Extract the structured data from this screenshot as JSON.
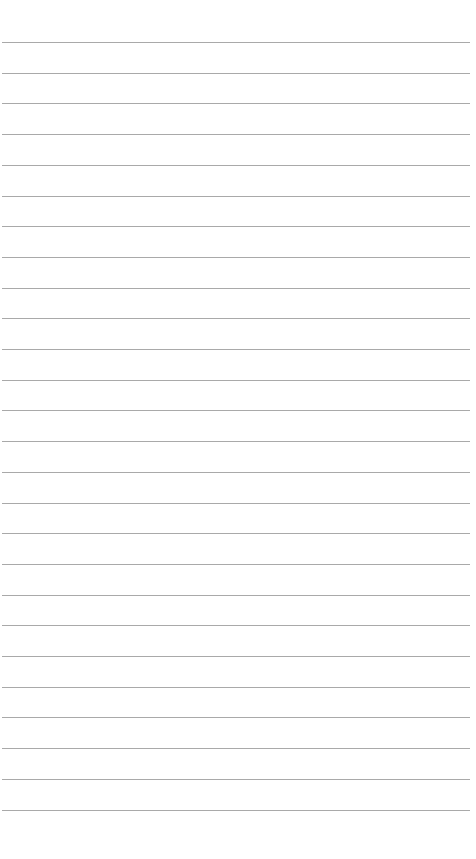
{
  "page": {
    "type": "lined-paper",
    "background_color": "#ffffff",
    "line_color": "#9a9a9a",
    "line_count": 26,
    "first_line_y": 42,
    "line_spacing": 30.7,
    "line_left": 2,
    "line_width": 468
  }
}
